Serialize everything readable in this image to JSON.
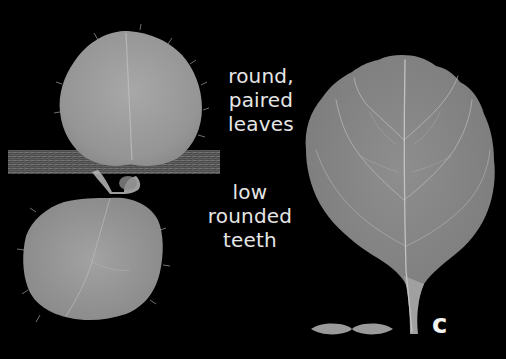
{
  "figure": {
    "background": "#000000",
    "panel_letter": "c",
    "annotations": {
      "top": {
        "lines": [
          "round,",
          "paired",
          "leaves"
        ]
      },
      "bottom": {
        "lines": [
          "low",
          "rounded",
          "teeth"
        ]
      }
    },
    "subjects": [
      {
        "name": "seedling-with-paired-leaves",
        "description": "two round hairy leaves on a horizontal stem"
      },
      {
        "name": "single-leaf",
        "description": "large rounded leaf with scalloped edge and long petiole"
      },
      {
        "name": "leaf-silhouette",
        "description": "small paired leaf outline icon"
      }
    ],
    "colors": {
      "leaf": "#9a9a9a",
      "leaf_light": "#b4b4b4",
      "vein": "#d0d0d0",
      "text": "#e6e6e6"
    }
  }
}
